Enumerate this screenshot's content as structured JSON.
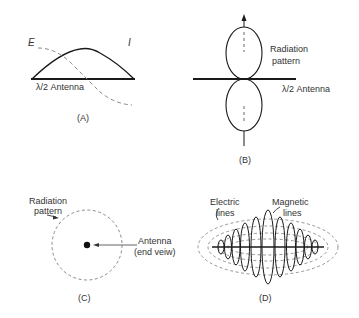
{
  "panels": {
    "A": {
      "caption": "(A)",
      "label_E": "E",
      "label_I": "I",
      "antenna_label": "λ/2 Antenna"
    },
    "B": {
      "caption": "(B)",
      "pattern_label_1": "Radiation",
      "pattern_label_2": "pattern",
      "antenna_label": "λ/2 Antenna"
    },
    "C": {
      "caption": "(C)",
      "pattern_label_1": "Radiation",
      "pattern_label_2": "pattern",
      "antenna_label_1": "Antenna",
      "antenna_label_2": "(end veiw)"
    },
    "D": {
      "caption": "(D)",
      "electric_label_1": "Electric",
      "electric_label_2": "lines",
      "magnetic_label_1": "Magnetic",
      "magnetic_label_2": "lines"
    }
  },
  "colors": {
    "line": "#1a1a1a",
    "dashed": "#8a8a8a"
  }
}
